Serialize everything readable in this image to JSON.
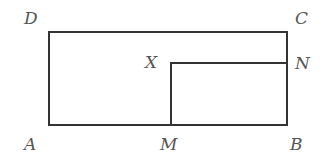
{
  "diagram": {
    "type": "geometry-rectangles",
    "stroke_color": "#333333",
    "label_color": "#555555",
    "outer_rectangle": {
      "vertices": [
        "A",
        "B",
        "C",
        "D"
      ],
      "coords": {
        "A": [
          49,
          125
        ],
        "B": [
          287,
          125
        ],
        "C": [
          287,
          32
        ],
        "D": [
          49,
          32
        ]
      }
    },
    "inner_rectangle": {
      "vertices": [
        "M",
        "B",
        "N",
        "X"
      ],
      "coords": {
        "M": [
          171,
          125
        ],
        "B": [
          287,
          125
        ],
        "N": [
          287,
          63
        ],
        "X": [
          171,
          63
        ]
      }
    },
    "labels": {
      "A": "A",
      "B": "B",
      "C": "C",
      "D": "D",
      "M": "M",
      "N": "N",
      "X": "X"
    }
  }
}
